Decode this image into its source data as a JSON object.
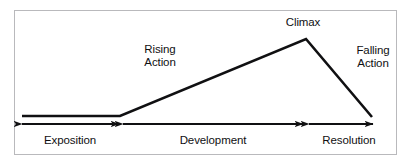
{
  "diagram": {
    "panel": {
      "background_color": "#ffffff",
      "border_color": "#b9b9bc"
    },
    "line_color": "#101012",
    "text_color": "#101012",
    "curve_labels": [
      {
        "name": "rising-action",
        "line1": "Rising",
        "line2": "Action",
        "text": "Rising\nAction"
      },
      {
        "name": "climax",
        "line1": "Climax",
        "line2": "",
        "text": "Climax"
      },
      {
        "name": "falling-action",
        "line1": "Falling",
        "line2": "Action",
        "text": "Falling\nAction"
      }
    ],
    "stage_labels": [
      {
        "name": "exposition",
        "text": "Exposition"
      },
      {
        "name": "development",
        "text": "Development"
      },
      {
        "name": "resolution",
        "text": "Resolution"
      }
    ],
    "plot_curve": {
      "description": "Narrative arc: flat exposition, rising action, climax peak, falling action",
      "points": [
        {
          "x": 22,
          "y": 116,
          "stage": "exposition-start"
        },
        {
          "x": 120,
          "y": 116,
          "stage": "exposition-end"
        },
        {
          "x": 306,
          "y": 39,
          "stage": "climax"
        },
        {
          "x": 372,
          "y": 117,
          "stage": "resolution-end"
        }
      ]
    },
    "measure_arrows": [
      {
        "name": "exposition-arrow",
        "x1": 22,
        "x2": 119,
        "y": 124,
        "double_headed": true
      },
      {
        "name": "development-arrow",
        "x1": 123,
        "x2": 303,
        "y": 124,
        "double_headed": true
      },
      {
        "name": "resolution-arrow",
        "x1": 309,
        "x2": 373,
        "y": 124,
        "double_headed": true
      }
    ]
  }
}
